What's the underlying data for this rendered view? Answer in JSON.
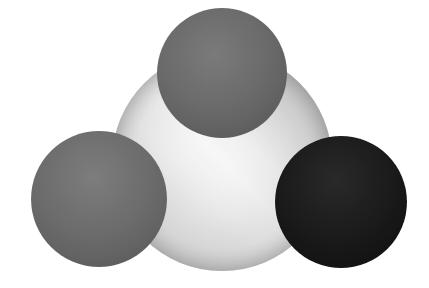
{
  "figure": {
    "background_color": "#ffffff",
    "canvas": {
      "width": 429,
      "height": 288
    }
  },
  "objects": [
    {
      "id": "center-sphere",
      "label": "Large gradient sphere",
      "shape": "circle",
      "center_x": 222,
      "center_y": 161,
      "radius": 110,
      "fill_kind": "diagonal-gradient",
      "color_dark": "#8d8d8d",
      "color_mid": "#c2c2c2",
      "color_bright": "#f4f4f4",
      "color_edge": "#9a9a9a",
      "highlight_direction": "lower-left to upper-right"
    },
    {
      "id": "top-sphere",
      "label": "Top dark gray sphere",
      "shape": "circle",
      "center_x": 222,
      "center_y": 73,
      "radius": 65,
      "fill_kind": "solid",
      "color": "#5a5a5a"
    },
    {
      "id": "left-sphere",
      "label": "Lower-left dark gray sphere",
      "shape": "circle",
      "center_x": 99,
      "center_y": 199,
      "radius": 68,
      "fill_kind": "solid",
      "color": "#5c5c5c"
    },
    {
      "id": "right-sphere",
      "label": "Lower-right black sphere",
      "shape": "circle",
      "center_x": 341,
      "center_y": 202,
      "radius": 66,
      "fill_kind": "solid",
      "color": "#161616"
    }
  ]
}
